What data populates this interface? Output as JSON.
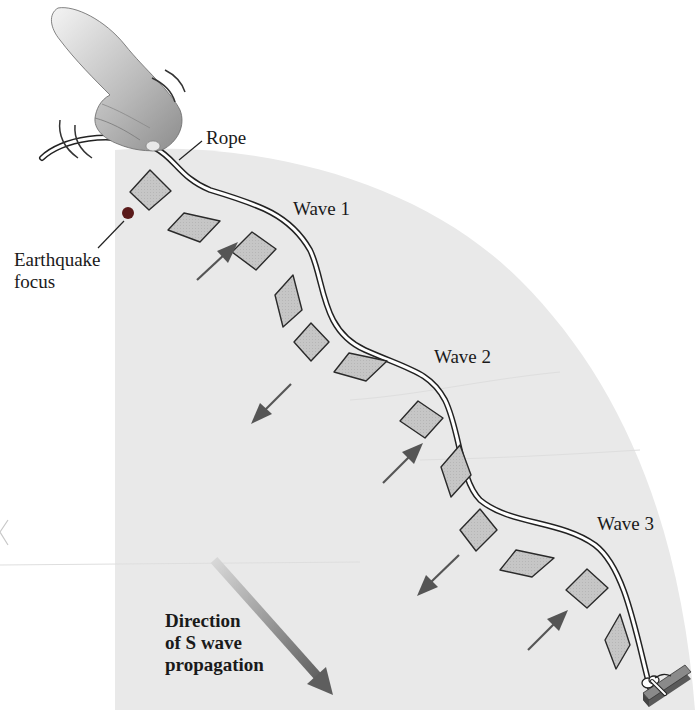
{
  "diagram": {
    "labels": {
      "rope": "Rope",
      "wave1": "Wave 1",
      "wave2": "Wave 2",
      "wave3": "Wave 3",
      "focus_line1": "Earthquake",
      "focus_line2": "focus",
      "direction_line1": "Direction",
      "direction_line2": "of S wave",
      "direction_line3": "propagation"
    },
    "colors": {
      "earth_region": "#e9e9e9",
      "diamond_fill": "#c4c4c4",
      "diamond_stroke": "#2a2a2a",
      "arrow": "#555555",
      "big_arrow": "#6a6a6a",
      "focus_dot": "#5a1a1a",
      "rope_stroke": "#222222",
      "anchor": "#7a7a7a"
    },
    "elements": {
      "hand": "hand-shaking-rope",
      "anchor": "rope-tied-to-stake",
      "diamond_count": 12,
      "particle_motion_arrows": 5
    }
  }
}
